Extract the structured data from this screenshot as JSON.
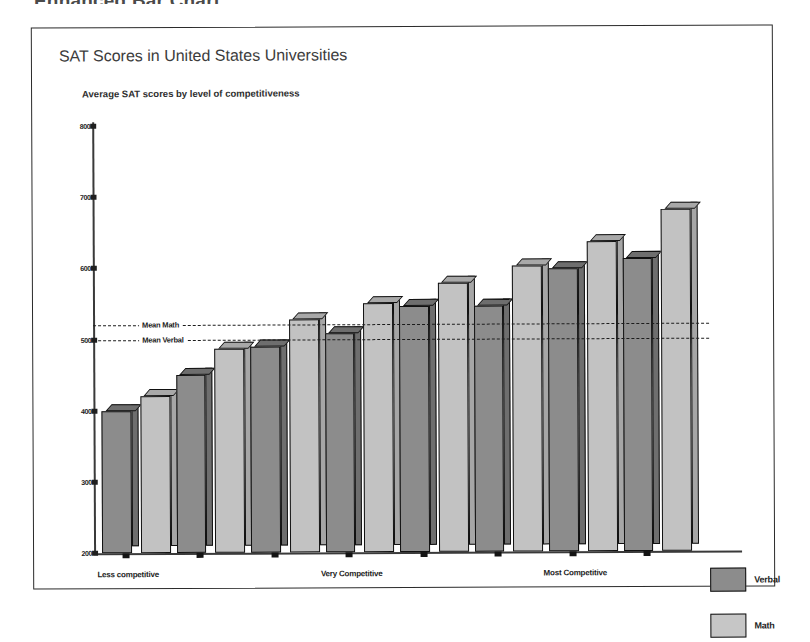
{
  "page": {
    "heading": "Enhanced Bar Chart"
  },
  "legend": {
    "position": "right",
    "entries": [
      {
        "label": "Verbal",
        "color": "#8c8c8c"
      },
      {
        "label": "Math",
        "color": "#c6c6c6"
      }
    ]
  },
  "chart_data": {
    "type": "bar",
    "title": "SAT Scores in United States Universities",
    "subtitle": "Average SAT scores by level of competitiveness",
    "xlabel": "",
    "ylabel": "",
    "ylim": [
      200,
      800
    ],
    "yticks": [
      200,
      300,
      400,
      500,
      600,
      700,
      800
    ],
    "ytick_labels": [
      "200",
      "300",
      "400",
      "500",
      "600",
      "700",
      "800"
    ],
    "grid": false,
    "categories": [
      "Less competitive",
      "",
      "",
      "Very Competitive",
      "",
      "",
      "Most Competitive",
      ""
    ],
    "xtick_labels": [
      "Less competitive",
      "Very Competitive",
      "Most Competitive"
    ],
    "series": [
      {
        "name": "Verbal",
        "color": "#8c8c8c",
        "values": [
          400,
          450,
          490,
          508,
          545,
          545,
          597,
          612
        ]
      },
      {
        "name": "Math",
        "color": "#c6c6c6",
        "values": [
          420,
          487,
          528,
          550,
          578,
          602,
          635,
          680
        ]
      }
    ],
    "reference_lines": [
      {
        "label": "Mean Math",
        "value": 520,
        "style": "dashed"
      },
      {
        "label": "Mean Verbal",
        "value": 500,
        "style": "dashed"
      }
    ]
  }
}
